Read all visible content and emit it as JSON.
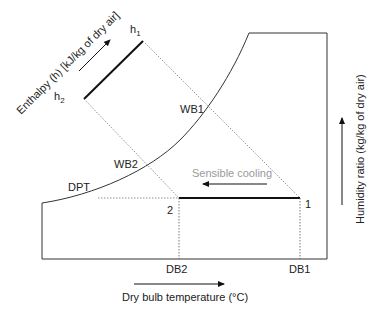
{
  "diagram": {
    "type": "psychrometric-chart-sensible-cooling",
    "axes": {
      "x_label": "Dry bulb temperature (°C)",
      "y_label": "Humidity ratio (kg/kg of dry air)",
      "enthalpy_label": "Enthalpy (h) [kJ/kg of dry air]"
    },
    "curve": {
      "label": "DPT"
    },
    "wet_bulb_lines": [
      {
        "label": "WB1"
      },
      {
        "label": "WB2"
      }
    ],
    "enthalpy_marks": [
      {
        "label": "h",
        "subscript": "1"
      },
      {
        "label": "h",
        "subscript": "2"
      }
    ],
    "state_points": [
      {
        "label": "1",
        "db_label": "DB1"
      },
      {
        "label": "2",
        "db_label": "DB2"
      }
    ],
    "process": {
      "label": "Sensible cooling"
    },
    "colors": {
      "line": "#333333",
      "thick_line": "#111111",
      "dotted": "#777777",
      "process_label": "#9a9a9a"
    }
  }
}
